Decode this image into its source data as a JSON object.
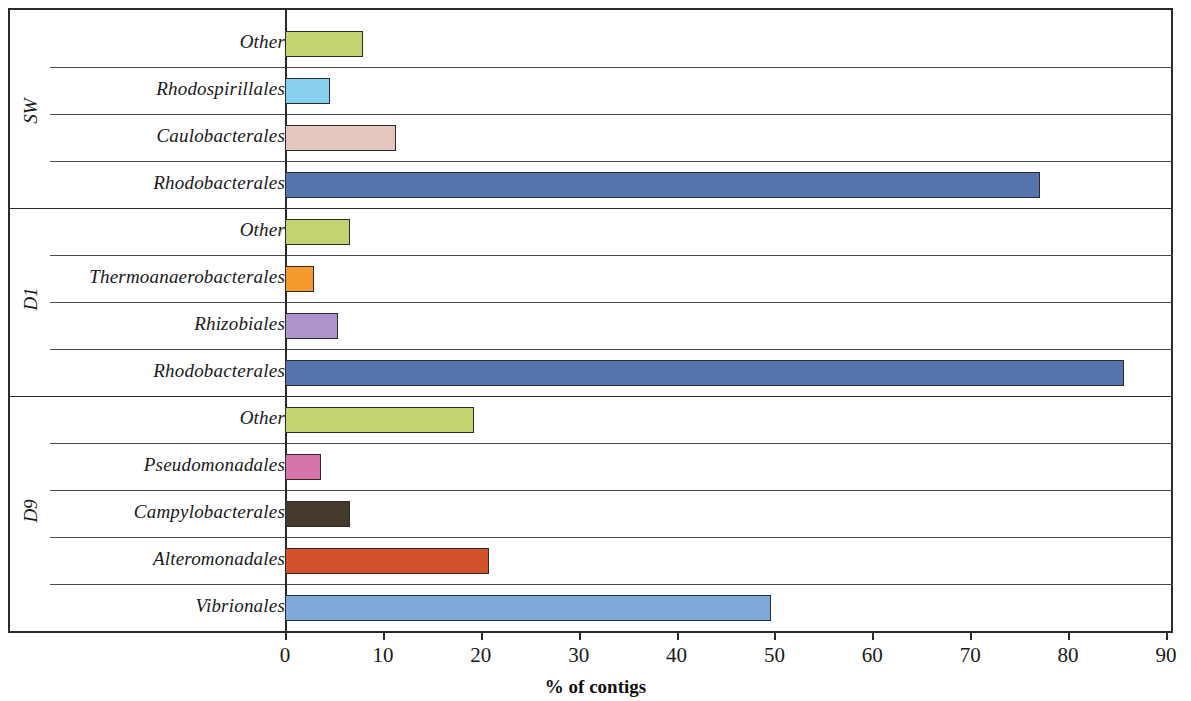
{
  "chart_data": {
    "type": "bar",
    "orientation": "horizontal",
    "title": "",
    "xlabel": "% of contigs",
    "ylabel": "",
    "xlim": [
      0,
      90
    ],
    "xticks": [
      0,
      10,
      20,
      30,
      40,
      50,
      60,
      70,
      80,
      90
    ],
    "xtick_labels": [
      "0",
      "10",
      "20",
      "30",
      "40",
      "50",
      "60",
      "70",
      "80",
      "90"
    ],
    "grid": false,
    "legend": "none",
    "groups": [
      {
        "name": "SW",
        "bars": [
          {
            "label": "Other",
            "value": 8.0,
            "color": "#c3d46e"
          },
          {
            "label": "Rhodospirillales",
            "value": 4.6,
            "color": "#86d0ee"
          },
          {
            "label": "Caulobacterales",
            "value": 11.3,
            "color": "#e5c6bd"
          },
          {
            "label": "Rhodobacterales",
            "value": 77.1,
            "color": "#5573ad"
          }
        ]
      },
      {
        "name": "D1",
        "bars": [
          {
            "label": "Other",
            "value": 6.6,
            "color": "#c3d46e"
          },
          {
            "label": "Thermoanaerobacterales",
            "value": 3.0,
            "color": "#f59a2e"
          },
          {
            "label": "Rhizobiales",
            "value": 5.4,
            "color": "#b193cc"
          },
          {
            "label": "Rhodobacterales",
            "value": 85.7,
            "color": "#5573ad"
          }
        ]
      },
      {
        "name": "D9",
        "bars": [
          {
            "label": "Other",
            "value": 19.3,
            "color": "#c3d46e"
          },
          {
            "label": "Pseudomonadales",
            "value": 3.7,
            "color": "#d874ab"
          },
          {
            "label": "Campylobacterales",
            "value": 6.6,
            "color": "#433a2c"
          },
          {
            "label": "Alteromonadales",
            "value": 20.8,
            "color": "#d2522b"
          },
          {
            "label": "Vibrionales",
            "value": 49.6,
            "color": "#7fa9db"
          }
        ]
      }
    ]
  },
  "axis": {
    "title": "% of contigs"
  }
}
